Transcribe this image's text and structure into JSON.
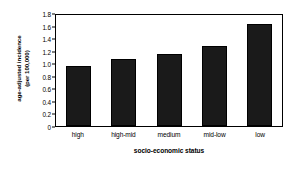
{
  "chart_data": {
    "type": "bar",
    "title": "",
    "categories": [
      "high",
      "high-mid",
      "medium",
      "mid-low",
      "low"
    ],
    "values": [
      0.96,
      1.07,
      1.14,
      1.27,
      1.63
    ],
    "xlabel": "socio-economic status",
    "ylabel": "age-adjusted incidence (per 100,000)",
    "ylabel_line1": "age-adjusted incidence",
    "ylabel_line2": "(per 100,000)",
    "ylim": [
      0,
      1.8
    ],
    "ytick_labels": [
      "1.8",
      "1.6",
      "1.4",
      "1.2",
      "1.0",
      "0.8",
      "0.6",
      "0.4",
      "0.2",
      "0"
    ],
    "ytick_values": [
      1.8,
      1.6,
      1.4,
      1.2,
      1.0,
      0.8,
      0.6,
      0.4,
      0.2,
      0
    ],
    "grid": false,
    "legend": "none",
    "bar_color": "#1a1a1a",
    "axis_color": "#000000",
    "background_color": "#ffffff"
  }
}
